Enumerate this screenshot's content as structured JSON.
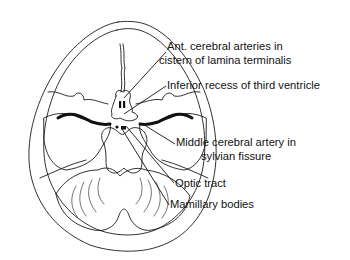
{
  "diagram": {
    "type": "anatomical-line-drawing",
    "line_color": "#1a1a1a",
    "background": "#ffffff"
  },
  "labels": [
    {
      "id": "ant-cerebral",
      "lines": [
        "Ant. cerebral arteries in",
        "cistern of lamina terminalis"
      ]
    },
    {
      "id": "inferior-recess",
      "lines": [
        "Inferior recess of third ventricle"
      ]
    },
    {
      "id": "middle-cerebral",
      "lines": [
        "Middle cerebral artery in",
        "sylvian fissure"
      ]
    },
    {
      "id": "optic-tract",
      "lines": [
        "Optic tract"
      ]
    },
    {
      "id": "mamillary",
      "lines": [
        "Mamillary bodies"
      ]
    }
  ]
}
